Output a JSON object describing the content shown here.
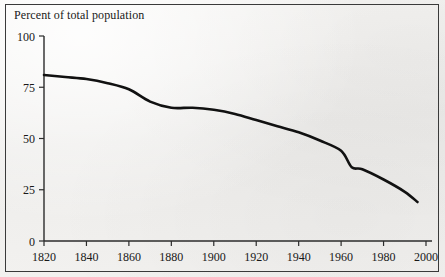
{
  "figure": {
    "title": "Percent of total population",
    "background_color": "#f2f1ef",
    "frame_color": "#3a3a3a",
    "line_color": "#111111"
  },
  "chart_data": {
    "type": "line",
    "title": "Percent of total population",
    "xlabel": "",
    "ylabel": "",
    "xlim": [
      1820,
      2000
    ],
    "ylim": [
      0,
      100
    ],
    "grid": false,
    "legend": "none",
    "xticks": [
      1820,
      1840,
      1860,
      1880,
      1900,
      1920,
      1940,
      1960,
      1980,
      2000
    ],
    "yticks": [
      0,
      25,
      50,
      75,
      100
    ],
    "xtick_labels": [
      "1820",
      "1840",
      "1860",
      "1880",
      "1900",
      "1920",
      "1940",
      "1960",
      "1980",
      "2000"
    ],
    "ytick_labels": [
      "0",
      "25",
      "50",
      "75",
      "100"
    ],
    "series": [
      {
        "name": "Percent of total population",
        "x": [
          1820,
          1830,
          1840,
          1850,
          1860,
          1870,
          1880,
          1890,
          1900,
          1910,
          1920,
          1930,
          1940,
          1950,
          1960,
          1965,
          1970,
          1980,
          1990,
          1996
        ],
        "values": [
          81,
          80,
          79,
          77,
          74,
          68,
          65,
          65,
          64,
          62,
          59,
          56,
          53,
          49,
          44,
          36,
          35,
          30,
          24,
          19
        ]
      }
    ]
  }
}
